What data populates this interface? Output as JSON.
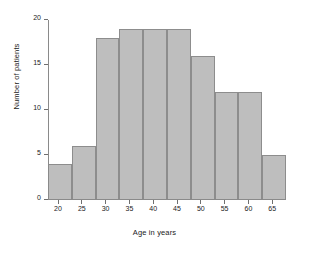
{
  "chart_data": {
    "type": "bar",
    "title": "",
    "xlabel": "Age in years",
    "ylabel": "Number of patients",
    "categories": [
      "18-23",
      "23-28",
      "28-33",
      "33-38",
      "38-43",
      "43-48",
      "48-53",
      "53-58",
      "58-63",
      "63-68"
    ],
    "bin_edges": [
      18,
      23,
      28,
      33,
      38,
      43,
      48,
      53,
      58,
      63,
      68
    ],
    "values": [
      4,
      6,
      18,
      19,
      19,
      19,
      16,
      12,
      12,
      5
    ],
    "xlim": [
      18,
      68
    ],
    "ylim": [
      0,
      20
    ],
    "xticks": [
      20,
      25,
      30,
      35,
      40,
      45,
      50,
      55,
      60,
      65
    ],
    "yticks": [
      0,
      5,
      10,
      15,
      20
    ],
    "xtick_labels": [
      "20",
      "25",
      "30",
      "35",
      "40",
      "45",
      "50",
      "55",
      "60",
      "65"
    ],
    "ytick_labels": [
      "0",
      "5",
      "10",
      "15",
      "20"
    ],
    "grid": false,
    "legend": false,
    "bar_fill": "#bebebe",
    "bar_edge": "#8d8d8d",
    "axis_color": "#8a8a8a",
    "background": "#ffffff"
  }
}
